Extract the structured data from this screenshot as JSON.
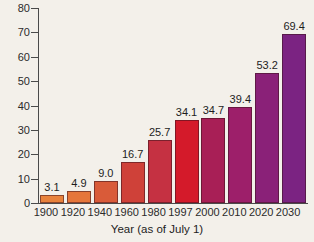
{
  "chart_data": {
    "type": "bar",
    "title": "",
    "xlabel": "Year (as of July 1)",
    "ylabel": "",
    "ylim": [
      0,
      80
    ],
    "yticks": [
      0,
      10,
      20,
      30,
      40,
      50,
      60,
      70,
      80
    ],
    "grid": false,
    "legend": "none",
    "categories": [
      "1900",
      "1920",
      "1940",
      "1960",
      "1980",
      "1997",
      "2000",
      "2010",
      "2020",
      "2030"
    ],
    "values": [
      3.1,
      4.9,
      9.0,
      16.7,
      25.7,
      34.1,
      34.7,
      39.4,
      53.2,
      69.4
    ],
    "value_labels": [
      "3.1",
      "4.9",
      "9.0",
      "16.7",
      "25.7",
      "34.1",
      "34.7",
      "39.4",
      "53.2",
      "69.4"
    ],
    "bar_colors": [
      "#e8823c",
      "#e5763a",
      "#d95b39",
      "#cf4139",
      "#c53142",
      "#d41a2a",
      "#a81f56",
      "#9d1f6a",
      "#8a2178",
      "#7b2382"
    ]
  }
}
